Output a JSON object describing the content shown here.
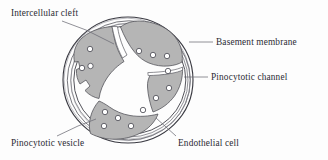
{
  "figure": {
    "background_color": "#fdfdfd",
    "ink_color": "#2b2b33",
    "cell_fill_color": "#b5b5b5",
    "cell_stroke_color": "#55555c",
    "vesicle_fill_color": "#ffffff",
    "membrane_stroke_color": "#3a3a42",
    "lumen_color": "#ffffff"
  },
  "labels": {
    "intercellular_cleft": "Intercellular cleft",
    "basement_membrane": "Basement membrane",
    "pinocytotic_channel": "Pinocytotic channel",
    "pinocytotic_vesicle": "Pinocytotic vesicle",
    "endothelial_cell": "Endothelial cell"
  },
  "structures": {
    "basement_membrane_rings": 4,
    "endothelial_cell_segments": 4,
    "pinocytotic_vesicle_count": 14,
    "intercellular_cleft_count": 1,
    "pinocytotic_channel_count": 1
  }
}
